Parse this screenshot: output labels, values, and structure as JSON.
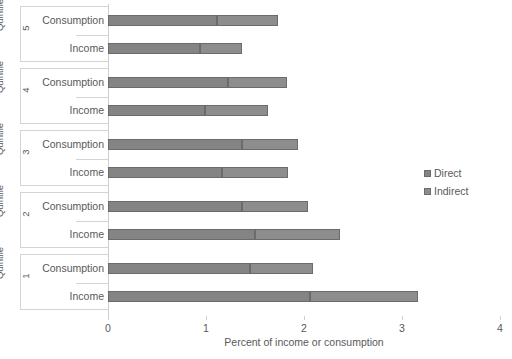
{
  "chart_data": {
    "type": "bar",
    "orientation": "horizontal",
    "stacked": true,
    "title": "",
    "xlabel": "Percent of income or consumption",
    "ylabel": "Quintile",
    "xlim": [
      0,
      4
    ],
    "xticks": [
      0,
      1,
      2,
      3,
      4
    ],
    "xtick_labels": [
      "0",
      "1",
      "2",
      "3",
      "4"
    ],
    "grid": false,
    "legend_position": "right",
    "series": [
      {
        "name": "Direct",
        "color": "#848484",
        "values": [
          1.45,
          2.06,
          1.37,
          1.5,
          1.37,
          1.16,
          1.22,
          0.99,
          1.11,
          0.94
        ]
      },
      {
        "name": "Indirect",
        "color": "#8d8d8d",
        "values": [
          0.64,
          1.1,
          0.67,
          0.87,
          0.57,
          0.68,
          0.61,
          0.64,
          0.62,
          0.43
        ]
      }
    ],
    "groups": [
      {
        "group_label": "Quintile",
        "group_number": "5",
        "categories": [
          "Consumption",
          "Income"
        ],
        "bars": [
          {
            "label": "Consumption",
            "direct": 1.11,
            "indirect": 0.62,
            "total": 1.73
          },
          {
            "label": "Income",
            "direct": 0.94,
            "indirect": 0.43,
            "total": 1.37
          }
        ]
      },
      {
        "group_label": "Quintile",
        "group_number": "4",
        "categories": [
          "Consumption",
          "Income"
        ],
        "bars": [
          {
            "label": "Consumption",
            "direct": 1.22,
            "indirect": 0.61,
            "total": 1.83
          },
          {
            "label": "Income",
            "direct": 0.99,
            "indirect": 0.64,
            "total": 1.63
          }
        ]
      },
      {
        "group_label": "Quintile",
        "group_number": "3",
        "categories": [
          "Consumption",
          "Income"
        ],
        "bars": [
          {
            "label": "Consumption",
            "direct": 1.37,
            "indirect": 0.57,
            "total": 1.94
          },
          {
            "label": "Income",
            "direct": 1.16,
            "indirect": 0.68,
            "total": 1.84
          }
        ]
      },
      {
        "group_label": "Quintile",
        "group_number": "2",
        "categories": [
          "Consumption",
          "Income"
        ],
        "bars": [
          {
            "label": "Consumption",
            "direct": 1.37,
            "indirect": 0.67,
            "total": 2.04
          },
          {
            "label": "Income",
            "direct": 1.5,
            "indirect": 0.87,
            "total": 2.37
          }
        ]
      },
      {
        "group_label": "Quintile",
        "group_number": "1",
        "categories": [
          "Consumption",
          "Income"
        ],
        "bars": [
          {
            "label": "Consumption",
            "direct": 1.45,
            "indirect": 0.64,
            "total": 2.09
          },
          {
            "label": "Income",
            "direct": 2.06,
            "indirect": 1.1,
            "total": 3.16
          }
        ]
      }
    ],
    "legend": [
      {
        "label": "Direct",
        "color": "#848484"
      },
      {
        "label": "Indirect",
        "color": "#8d8d8d"
      }
    ]
  },
  "axis": {
    "x_title": "Percent of income or consumption",
    "tick_0": "0",
    "tick_1": "1",
    "tick_2": "2",
    "tick_3": "3",
    "tick_4": "4"
  },
  "legend": {
    "direct_label": "Direct",
    "indirect_label": "Indirect"
  },
  "colors": {
    "direct": "#848484",
    "indirect": "#8d8d8d",
    "border": "#6b6b6b",
    "axis": "#cfcfcf",
    "text": "#595959",
    "background": "#ffffff"
  }
}
